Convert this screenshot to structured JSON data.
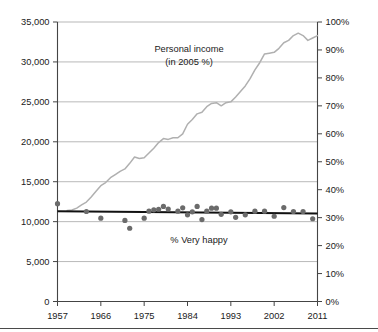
{
  "chart_data": {
    "type": "scatter",
    "title": "",
    "xlabel": "",
    "ylabel": "",
    "grid": true,
    "legend_position": "inline-annotation",
    "x": [
      1957,
      1958,
      1959,
      1960,
      1961,
      1962,
      1963,
      1964,
      1965,
      1966,
      1967,
      1968,
      1969,
      1970,
      1971,
      1972,
      1973,
      1974,
      1975,
      1976,
      1977,
      1978,
      1979,
      1980,
      1981,
      1982,
      1983,
      1984,
      1985,
      1986,
      1987,
      1988,
      1989,
      1990,
      1991,
      1992,
      1993,
      1994,
      1995,
      1996,
      1997,
      1998,
      1999,
      2000,
      2001,
      2002,
      2003,
      2004,
      2005,
      2006,
      2007,
      2008,
      2009,
      2010,
      2011
    ],
    "xlim": [
      1957,
      2011
    ],
    "xticks": [
      1957,
      1966,
      1975,
      1984,
      1993,
      2002,
      2011
    ],
    "xtick_labels": [
      "1957",
      "1966",
      "1975",
      "1984",
      "1993",
      "2002",
      "2011"
    ],
    "left_axis": {
      "label": "Personal income (in 2005 %)",
      "ylim": [
        0,
        35000
      ],
      "yticks": [
        0,
        5000,
        10000,
        15000,
        20000,
        25000,
        30000,
        35000
      ],
      "ytick_labels": [
        "0",
        "5,000",
        "10,000",
        "15,000",
        "20,000",
        "25,000",
        "30,000",
        "35,000"
      ],
      "color": "#b0b0b0"
    },
    "right_axis": {
      "label": "% Very happy",
      "ylim": [
        0,
        100
      ],
      "yticks": [
        0,
        10,
        20,
        30,
        40,
        50,
        60,
        70,
        80,
        90,
        100
      ],
      "ytick_labels": [
        "0%",
        "10%",
        "20%",
        "30%",
        "40%",
        "50%",
        "60%",
        "70%",
        "80%",
        "90%",
        "100%"
      ],
      "color": "#6b6b6b"
    },
    "series": [
      {
        "name": "Personal income",
        "annotation_line1": "Personal income",
        "annotation_line2": "(in 2005 %)",
        "type": "line",
        "axis": "left",
        "color": "#b0b0b0",
        "x": [
          1959,
          1960,
          1961,
          1962,
          1963,
          1964,
          1965,
          1966,
          1967,
          1968,
          1969,
          1970,
          1971,
          1972,
          1973,
          1974,
          1975,
          1976,
          1977,
          1978,
          1979,
          1980,
          1981,
          1982,
          1983,
          1984,
          1985,
          1986,
          1987,
          1988,
          1989,
          1990,
          1991,
          1992,
          1993,
          1994,
          1995,
          1996,
          1997,
          1998,
          1999,
          2000,
          2001,
          2002,
          2003,
          2004,
          2005,
          2006,
          2007,
          2008,
          2009,
          2010,
          2011
        ],
        "values": [
          11400,
          11450,
          11700,
          12100,
          12450,
          13100,
          13800,
          14500,
          14900,
          15500,
          15900,
          16300,
          16600,
          17300,
          18100,
          17900,
          18000,
          18600,
          19200,
          19900,
          20400,
          20300,
          20500,
          20500,
          21000,
          22200,
          22800,
          23500,
          23700,
          24400,
          24800,
          24900,
          24500,
          24900,
          25000,
          25600,
          26300,
          27000,
          27900,
          29000,
          29900,
          31000,
          31100,
          31200,
          31700,
          32400,
          32700,
          33300,
          33600,
          33300,
          32700,
          33000,
          33300
        ]
      },
      {
        "name": "% Very happy",
        "annotation": "% Very happy",
        "type": "scatter",
        "axis": "right",
        "color": "#6b6b6b",
        "points": [
          {
            "x": 1957,
            "y": 35.0
          },
          {
            "x": 1963,
            "y": 32.2
          },
          {
            "x": 1966,
            "y": 29.8
          },
          {
            "x": 1971,
            "y": 29.0
          },
          {
            "x": 1972,
            "y": 26.2
          },
          {
            "x": 1975,
            "y": 29.8
          },
          {
            "x": 1976,
            "y": 32.3
          },
          {
            "x": 1977,
            "y": 32.8
          },
          {
            "x": 1978,
            "y": 33.0
          },
          {
            "x": 1979,
            "y": 34.0
          },
          {
            "x": 1980,
            "y": 33.1
          },
          {
            "x": 1982,
            "y": 32.3
          },
          {
            "x": 1983,
            "y": 33.5
          },
          {
            "x": 1984,
            "y": 31.0
          },
          {
            "x": 1985,
            "y": 32.1
          },
          {
            "x": 1986,
            "y": 34.0
          },
          {
            "x": 1987,
            "y": 29.3
          },
          {
            "x": 1988,
            "y": 32.3
          },
          {
            "x": 1989,
            "y": 33.4
          },
          {
            "x": 1990,
            "y": 33.4
          },
          {
            "x": 1991,
            "y": 31.2
          },
          {
            "x": 1993,
            "y": 32.1
          },
          {
            "x": 1994,
            "y": 30.1
          },
          {
            "x": 1996,
            "y": 31.0
          },
          {
            "x": 1998,
            "y": 32.3
          },
          {
            "x": 2000,
            "y": 32.3
          },
          {
            "x": 2002,
            "y": 30.5
          },
          {
            "x": 2004,
            "y": 33.6
          },
          {
            "x": 2006,
            "y": 32.2
          },
          {
            "x": 2008,
            "y": 32.2
          },
          {
            "x": 2010,
            "y": 29.6
          }
        ]
      },
      {
        "name": "Very happy trend line",
        "type": "line",
        "axis": "right",
        "color": "#111111",
        "x": [
          1957,
          2011
        ],
        "values": [
          32.3,
          31.5
        ]
      }
    ]
  }
}
